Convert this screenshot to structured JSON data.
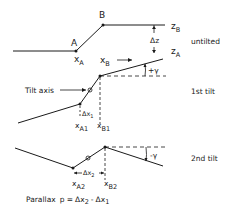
{
  "diagram": {
    "type": "parallax-tilt-geometry",
    "colors": {
      "ink": "#1a1a1a",
      "background": "#ffffff"
    },
    "untilted": {
      "label": "untilted",
      "point_a": "A",
      "point_b": "B",
      "x_a": "x",
      "x_a_sub": "A",
      "z_b": "z",
      "z_b_sub": "B",
      "z_a": "z",
      "z_a_sub": "A",
      "delta_z": "Δz"
    },
    "first_tilt": {
      "label": "1st tilt",
      "tilt_axis": "Tilt axis",
      "x_b": "x",
      "x_b_sub": "B",
      "angle": "+γ",
      "delta_x": "Δx",
      "delta_x_sub": "1",
      "x_a1": "x",
      "x_a1_sub": "A1",
      "x_b1": "x",
      "x_b1_sub": "B1"
    },
    "second_tilt": {
      "label": "2nd tilt",
      "angle": "-γ",
      "delta_x": "Δx",
      "delta_x_sub": "2",
      "x_a2": "x",
      "x_a2_sub": "A2",
      "x_b2": "x",
      "x_b2_sub": "B2"
    },
    "formula": {
      "prefix": "Parallax",
      "p": "p =",
      "term1": "Δx",
      "term1_sub": "2",
      "minus": "-",
      "term2": "Δx",
      "term2_sub": "1"
    }
  }
}
